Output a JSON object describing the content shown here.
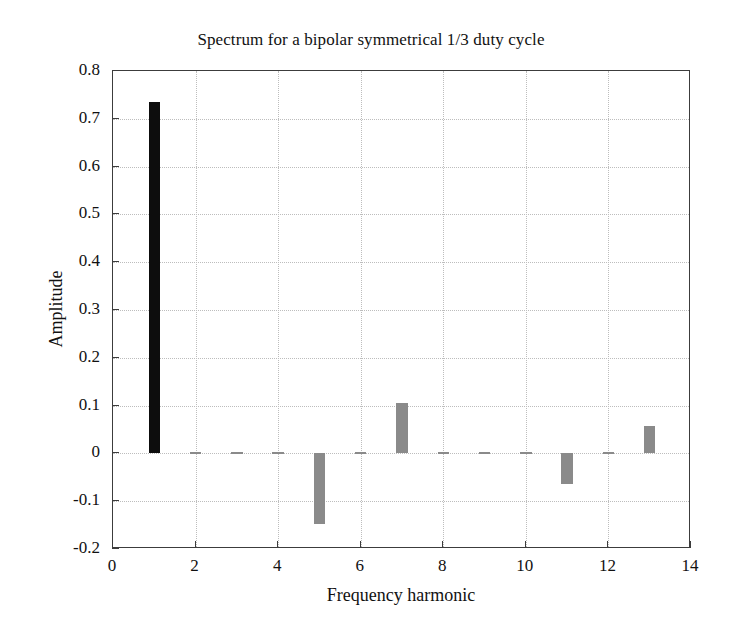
{
  "chart_data": {
    "type": "bar",
    "title": "Spectrum for a bipolar symmetrical 1/3 duty cycle",
    "xlabel": "Frequency harmonic",
    "ylabel": "Amplitude",
    "xlim": [
      0,
      14
    ],
    "ylim": [
      -0.2,
      0.8
    ],
    "grid": true,
    "legend": null,
    "xticks": [
      0,
      2,
      4,
      6,
      8,
      10,
      12,
      14
    ],
    "xtick_labels": [
      "0",
      "2",
      "4",
      "6",
      "8",
      "10",
      "12",
      "14"
    ],
    "yticks": [
      0.8,
      0.7,
      0.6,
      0.5,
      0.4,
      0.3,
      0.2,
      0.1,
      0,
      -0.1,
      -0.2
    ],
    "ytick_labels": [
      "0.8",
      "0.7",
      "0.6",
      "0.5",
      "0.4",
      "0.3",
      "0.2",
      "0.1",
      "0",
      "-0.1",
      "-0.2"
    ],
    "categories": [
      1,
      2,
      3,
      4,
      5,
      6,
      7,
      8,
      9,
      10,
      11,
      12,
      13
    ],
    "values": [
      0.735,
      0.0,
      0.0,
      0.0,
      -0.147,
      0.0,
      0.105,
      0.0,
      0.0,
      0.0,
      -0.065,
      0.0,
      0.058
    ],
    "bar_colors": [
      "#0d0d0d",
      "#8a8a8a",
      "#8a8a8a",
      "#8a8a8a",
      "#8a8a8a",
      "#8a8a8a",
      "#8a8a8a",
      "#8a8a8a",
      "#8a8a8a",
      "#8a8a8a",
      "#8a8a8a",
      "#8a8a8a",
      "#8a8a8a"
    ],
    "bar_width_units": 0.28,
    "axis_color": "#3c3c3c",
    "grid_color": "#bdbdbd",
    "background": "#ffffff"
  }
}
